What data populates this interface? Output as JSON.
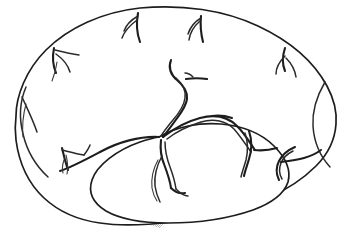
{
  "figure": {
    "title": "Lateral view of cerebral hemisphere with vascular territory",
    "view": "lateral",
    "caption": "",
    "background_color": "#ffffff",
    "outline_color": "#1d1d1d",
    "vessel_color": "#2a2a2a",
    "stipple_color": "#c9c9c9"
  },
  "regions": [
    {
      "id": "cerebral-hemisphere",
      "label": "cerebral hemisphere outline",
      "fill": "#ffffff",
      "stroke": "#1d1d1d"
    },
    {
      "id": "temporal-lobe",
      "label": "temporal lobe outline",
      "fill": "#ffffff",
      "stroke": "#1d1d1d"
    },
    {
      "id": "vascular-territory-band",
      "label": "stippled vascular territory (C-shaped band)",
      "fill": "#c9c9c9",
      "pattern": "stipple-checker"
    },
    {
      "id": "temporal-territory-band",
      "label": "stippled temporal territory strip",
      "fill": "#c9c9c9",
      "pattern": "stipple-checker"
    }
  ],
  "vessels": [
    {
      "id": "vessel-frontal-superior-left",
      "label": "left superior frontal branch"
    },
    {
      "id": "vessel-frontal-lateral-left",
      "label": "left lateral frontal branch"
    },
    {
      "id": "vessel-frontal-inferior-left",
      "label": "left inferior frontal branch"
    },
    {
      "id": "vessel-precentral",
      "label": "precentral branch"
    },
    {
      "id": "vessel-central-sulcus",
      "label": "central sulcus branch"
    },
    {
      "id": "vessel-postcentral",
      "label": "postcentral branch"
    },
    {
      "id": "vessel-parietal-posterior",
      "label": "posterior parietal branch"
    },
    {
      "id": "vessel-occipital",
      "label": "occipital branch"
    },
    {
      "id": "vessel-sylvian-trunk",
      "label": "sylvian trunk"
    },
    {
      "id": "vessel-temporal-anterior",
      "label": "anterior temporal branch"
    },
    {
      "id": "vessel-temporal-middle",
      "label": "middle temporal branch"
    },
    {
      "id": "vessel-temporal-posterior",
      "label": "posterior temporal branch"
    },
    {
      "id": "vessel-orbital-inferior",
      "label": "inferior orbital branch"
    }
  ],
  "legend": {
    "visible": false,
    "entries": []
  },
  "annotations": {
    "visible": false,
    "items": []
  }
}
